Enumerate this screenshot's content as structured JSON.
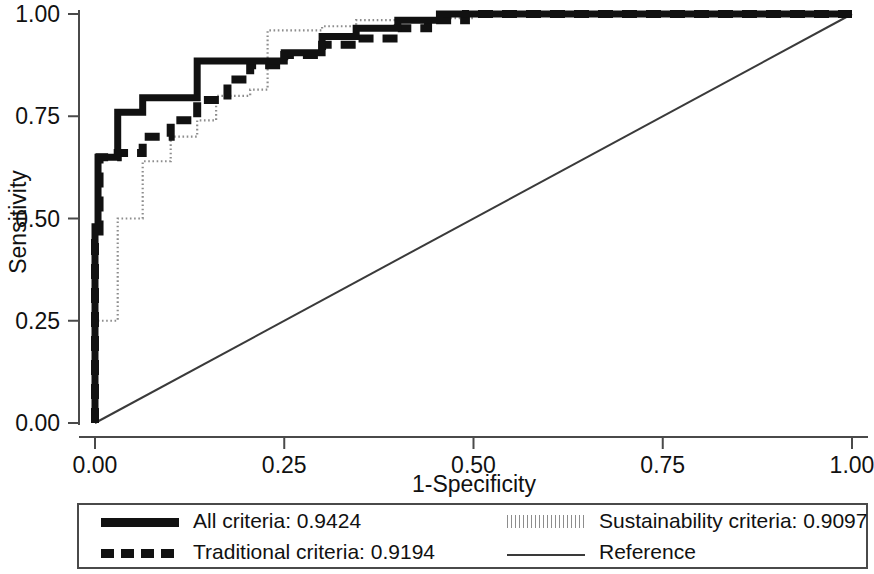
{
  "chart_data": {
    "type": "line",
    "title": "",
    "xlabel": "1-Specificity",
    "ylabel": "Sensitivity",
    "xlim": [
      0,
      1
    ],
    "ylim": [
      0,
      1
    ],
    "xticks": [
      "0.00",
      "0.25",
      "0.50",
      "0.75",
      "1.00"
    ],
    "xtick_values": [
      0,
      0.25,
      0.5,
      0.75,
      1
    ],
    "yticks": [
      "0.00",
      "0.25",
      "0.50",
      "0.75",
      "1.00"
    ],
    "ytick_values": [
      0,
      0.25,
      0.5,
      0.75,
      1
    ],
    "grid": false,
    "legend_position": "below-plot",
    "series": [
      {
        "name": "All criteria",
        "auc": "0.9424",
        "style": "solid-thick",
        "color": "#111111",
        "points": [
          [
            0.0,
            0.0
          ],
          [
            0.0,
            0.48
          ],
          [
            0.004,
            0.48
          ],
          [
            0.004,
            0.65
          ],
          [
            0.03,
            0.65
          ],
          [
            0.03,
            0.76
          ],
          [
            0.063,
            0.76
          ],
          [
            0.063,
            0.795
          ],
          [
            0.135,
            0.795
          ],
          [
            0.135,
            0.885
          ],
          [
            0.25,
            0.885
          ],
          [
            0.25,
            0.905
          ],
          [
            0.3,
            0.905
          ],
          [
            0.3,
            0.945
          ],
          [
            0.345,
            0.945
          ],
          [
            0.345,
            0.965
          ],
          [
            0.4,
            0.965
          ],
          [
            0.4,
            0.985
          ],
          [
            0.455,
            0.985
          ],
          [
            0.455,
            1.0
          ],
          [
            1.0,
            1.0
          ]
        ]
      },
      {
        "name": "Traditional criteria",
        "auc": "0.9194",
        "style": "dashed-thick",
        "color": "#111111",
        "points": [
          [
            0.0,
            0.0
          ],
          [
            0.0,
            0.44
          ],
          [
            0.006,
            0.44
          ],
          [
            0.006,
            0.65
          ],
          [
            0.03,
            0.65
          ],
          [
            0.03,
            0.66
          ],
          [
            0.063,
            0.66
          ],
          [
            0.063,
            0.7
          ],
          [
            0.1,
            0.7
          ],
          [
            0.1,
            0.74
          ],
          [
            0.135,
            0.74
          ],
          [
            0.135,
            0.79
          ],
          [
            0.175,
            0.79
          ],
          [
            0.175,
            0.84
          ],
          [
            0.205,
            0.84
          ],
          [
            0.205,
            0.875
          ],
          [
            0.25,
            0.875
          ],
          [
            0.25,
            0.9
          ],
          [
            0.3,
            0.9
          ],
          [
            0.3,
            0.925
          ],
          [
            0.345,
            0.925
          ],
          [
            0.345,
            0.94
          ],
          [
            0.4,
            0.94
          ],
          [
            0.4,
            0.965
          ],
          [
            0.44,
            0.965
          ],
          [
            0.44,
            0.985
          ],
          [
            0.49,
            0.985
          ],
          [
            0.49,
            1.0
          ],
          [
            1.0,
            1.0
          ]
        ]
      },
      {
        "name": "Sustainability criteria",
        "auc": "0.9097",
        "style": "dotted-fine",
        "color": "#8d8d8d",
        "points": [
          [
            0.0,
            0.0
          ],
          [
            0.0,
            0.25
          ],
          [
            0.03,
            0.25
          ],
          [
            0.03,
            0.5
          ],
          [
            0.063,
            0.5
          ],
          [
            0.063,
            0.64
          ],
          [
            0.1,
            0.64
          ],
          [
            0.1,
            0.7
          ],
          [
            0.135,
            0.7
          ],
          [
            0.135,
            0.74
          ],
          [
            0.16,
            0.74
          ],
          [
            0.16,
            0.8
          ],
          [
            0.205,
            0.8
          ],
          [
            0.205,
            0.815
          ],
          [
            0.228,
            0.815
          ],
          [
            0.228,
            0.96
          ],
          [
            0.3,
            0.96
          ],
          [
            0.3,
            0.97
          ],
          [
            0.345,
            0.97
          ],
          [
            0.345,
            0.985
          ],
          [
            0.4,
            0.985
          ],
          [
            0.4,
            0.99
          ],
          [
            0.5,
            0.99
          ],
          [
            0.5,
            1.0
          ],
          [
            1.0,
            1.0
          ]
        ]
      },
      {
        "name": "Reference",
        "auc": "",
        "style": "solid-thin",
        "color": "#3a3a3a",
        "points": [
          [
            0.0,
            0.0
          ],
          [
            1.0,
            1.0
          ]
        ]
      }
    ]
  },
  "axes": {
    "x_title": "1-Specificity",
    "y_title": "Sensitivity",
    "x_tick_0": "0.00",
    "x_tick_1": "0.25",
    "x_tick_2": "0.50",
    "x_tick_3": "0.75",
    "x_tick_4": "1.00",
    "y_tick_0": "0.00",
    "y_tick_1": "0.25",
    "y_tick_2": "0.50",
    "y_tick_3": "0.75",
    "y_tick_4": "1.00"
  },
  "legend": {
    "entries": [
      {
        "label": "All criteria: 0.9424",
        "style": "solid-thick"
      },
      {
        "label": "Sustainability criteria: 0.9097",
        "style": "dotted-fine"
      },
      {
        "label": "Traditional criteria: 0.9194",
        "style": "dashed-thick"
      },
      {
        "label": "Reference",
        "style": "solid-thin"
      }
    ]
  },
  "colors": {
    "curve_dark": "#111111",
    "curve_light": "#8d8d8d",
    "reference": "#3a3a3a",
    "axis": "#4a4a4a",
    "background": "#ffffff"
  }
}
